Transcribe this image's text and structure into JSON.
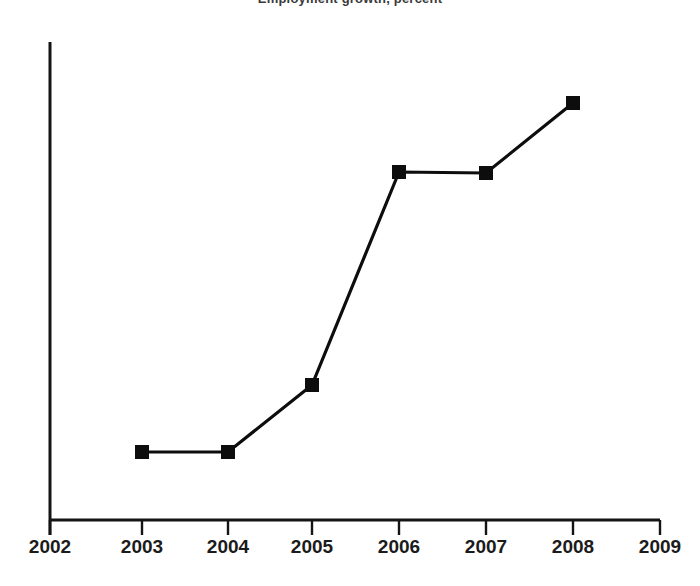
{
  "chart_data": {
    "type": "line",
    "title": "Employment growth, percent",
    "xlabel": "",
    "ylabel": "",
    "x": [
      2003,
      2004,
      2005,
      2006,
      2007,
      2008
    ],
    "values": [
      1.0,
      1.0,
      2.6,
      7.6,
      7.55,
      9.25
    ],
    "series": [
      {
        "name": "series-1",
        "x": [
          2003,
          2004,
          2005,
          2006,
          2007,
          2008
        ],
        "values": [
          1.0,
          1.0,
          2.6,
          7.6,
          7.55,
          9.25
        ]
      }
    ],
    "x_tick_labels": [
      "2002",
      "2003",
      "2004",
      "2005",
      "2006",
      "2007",
      "2008",
      "2009"
    ],
    "x_ticks": [
      2002,
      2003,
      2004,
      2005,
      2006,
      2007,
      2008,
      2009
    ],
    "y_tick_labels": [],
    "xlim": [
      2002,
      2009
    ],
    "ylim": [
      0,
      11
    ],
    "grid": false,
    "legend": false,
    "legend_position": "none",
    "marker": "square",
    "line_color": "#0d0d0d",
    "marker_color": "#0d0d0d",
    "axis_color": "#141414",
    "background_color": "#ffffff",
    "annotations": []
  },
  "geometry": {
    "axis": {
      "y_axis_x": 50,
      "y_axis_top": 42,
      "y_axis_bottom": 535,
      "x_axis_y": 520,
      "x_axis_left": 50,
      "x_axis_right": 660
    },
    "tick_px": [
      50,
      142,
      228,
      312,
      399,
      486,
      573,
      660
    ],
    "tick_label_y": 537,
    "points_px": [
      {
        "x": 142,
        "y": 452
      },
      {
        "x": 228,
        "y": 452
      },
      {
        "x": 312,
        "y": 385
      },
      {
        "x": 399,
        "y": 172
      },
      {
        "x": 486,
        "y": 173
      },
      {
        "x": 573,
        "y": 103
      }
    ],
    "marker_size": 13
  }
}
